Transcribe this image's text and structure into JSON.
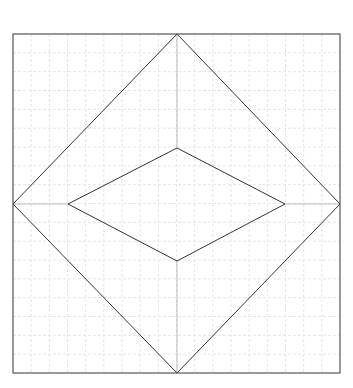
{
  "diagram": {
    "type": "geometric-figure",
    "colors": {
      "background": "#ffffff",
      "grid": "#e6e6e6",
      "border": "#555555",
      "diamond": "#333333",
      "connector": "#bbbbbb"
    },
    "frame": {
      "x": 13,
      "y": 34,
      "width": 327,
      "height": 339
    },
    "grid": {
      "cols": 18,
      "rows": 18,
      "dashed": true
    },
    "outer_diamond": {
      "points": [
        [
          177,
          34
        ],
        [
          340,
          204
        ],
        [
          177,
          373
        ],
        [
          13,
          204
        ]
      ]
    },
    "inner_diamond": {
      "points": [
        [
          177,
          148
        ],
        [
          285,
          204
        ],
        [
          177,
          261
        ],
        [
          68,
          204
        ]
      ]
    },
    "connectors": [
      {
        "from": [
          177,
          34
        ],
        "to": [
          177,
          148
        ]
      },
      {
        "from": [
          340,
          204
        ],
        "to": [
          285,
          204
        ]
      },
      {
        "from": [
          177,
          373
        ],
        "to": [
          177,
          261
        ]
      },
      {
        "from": [
          13,
          204
        ],
        "to": [
          68,
          204
        ]
      }
    ]
  }
}
